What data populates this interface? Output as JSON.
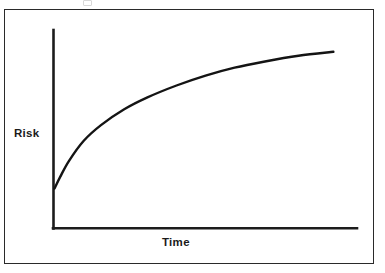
{
  "figure": {
    "name": "risk-vs-time-curve",
    "background_color": "#ffffff",
    "frame_color": "#2a2a2a",
    "line_color": "#141414"
  },
  "chart_data": {
    "type": "line",
    "title": "",
    "subtitle": "",
    "xlabel": "Time",
    "ylabel": "Risk",
    "grid": false,
    "legend": null,
    "axis_style": "open-L-axes-no-ticks",
    "xlim": [
      0,
      1
    ],
    "ylim": [
      0,
      1
    ],
    "x_tick_labels": [],
    "y_tick_labels": [],
    "annotations": [],
    "series": [
      {
        "name": "Risk",
        "description": "Monotonically increasing, concave-down (diminishing rate) curve",
        "x": [
          0.0,
          0.02,
          0.05,
          0.1,
          0.16,
          0.24,
          0.32,
          0.42,
          0.52,
          0.62,
          0.72,
          0.84,
          0.96
        ],
        "y": [
          0.2,
          0.26,
          0.34,
          0.44,
          0.52,
          0.6,
          0.66,
          0.72,
          0.77,
          0.81,
          0.84,
          0.87,
          0.89
        ]
      }
    ]
  },
  "labels": {
    "y_axis": "Risk",
    "x_axis": "Time"
  }
}
